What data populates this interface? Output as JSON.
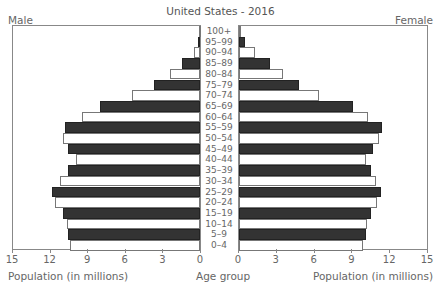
{
  "header": {
    "title": "United States - 2016",
    "male_label": "Male",
    "female_label": "Female"
  },
  "axes": {
    "male_xlabel": "Population (in millions)",
    "female_xlabel": "Population (in millions)",
    "center_label": "Age group",
    "male_ticks": [
      "15",
      "12",
      "9",
      "6",
      "3",
      "0"
    ],
    "female_ticks": [
      "0",
      "3",
      "6",
      "9",
      "12",
      "15"
    ]
  },
  "colors": {
    "dark_bar": "#333333",
    "light_bar": "#ffffff",
    "frame": "#888888"
  },
  "chart_data": {
    "type": "bar",
    "subtype": "population-pyramid",
    "title": "United States - 2016",
    "xlabel": "Population (in millions)",
    "ylabel": "Age group",
    "xlim": [
      0,
      15
    ],
    "categories": [
      "100+",
      "95–99",
      "90–94",
      "85–89",
      "80–84",
      "75–79",
      "70–74",
      "65–69",
      "60–64",
      "55–59",
      "50–54",
      "45–49",
      "40–44",
      "35–39",
      "30–34",
      "25–29",
      "20–24",
      "15–19",
      "10–14",
      "5–9",
      "0–4"
    ],
    "series": [
      {
        "name": "Male",
        "values": [
          0.1,
          0.15,
          0.5,
          1.4,
          2.4,
          3.7,
          5.4,
          8.0,
          9.4,
          10.8,
          10.9,
          10.5,
          9.9,
          10.5,
          11.2,
          11.8,
          11.6,
          10.9,
          10.6,
          10.5,
          10.4
        ]
      },
      {
        "name": "Female",
        "values": [
          0.1,
          0.5,
          1.3,
          2.5,
          3.5,
          4.8,
          6.4,
          9.1,
          10.3,
          11.4,
          11.2,
          10.7,
          10.1,
          10.5,
          10.9,
          11.3,
          11.0,
          10.5,
          10.2,
          10.1,
          9.9
        ]
      }
    ],
    "legend": [
      "Male (left)",
      "Female (right)"
    ],
    "grid": false
  }
}
